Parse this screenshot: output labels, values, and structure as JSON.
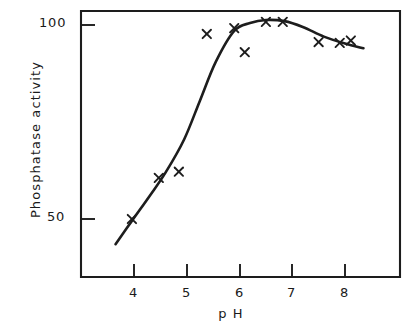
{
  "figure": {
    "background_color": "#ffffff",
    "ink_color": "#1d1d1d",
    "style": "hand-drawn scientific line plot, scanned journal figure"
  },
  "labels": {
    "ylabel": "Phosphatase activity",
    "xlabel": "p H"
  },
  "axes": {
    "y_ticks": [
      {
        "label": "100",
        "value": 100
      },
      {
        "label": "50",
        "value": 50
      }
    ],
    "x_ticks": [
      {
        "label": "4",
        "value": 4
      },
      {
        "label": "5",
        "value": 5
      },
      {
        "label": "6",
        "value": 6
      },
      {
        "label": "7",
        "value": 7
      },
      {
        "label": "8",
        "value": 8
      }
    ]
  },
  "chart_data": {
    "type": "scatter",
    "title": "",
    "xlabel": "p H",
    "ylabel": "Phosphatase activity",
    "xlim": [
      3.3,
      8.95
    ],
    "ylim": [
      31,
      106
    ],
    "grid": false,
    "legend": null,
    "marker": "x",
    "series": [
      {
        "name": "Phosphatase activity",
        "marker": "x",
        "points": [
          {
            "x": 3.96,
            "y": 50
          },
          {
            "x": 4.47,
            "y": 60.6
          },
          {
            "x": 4.85,
            "y": 62.2
          },
          {
            "x": 5.38,
            "y": 97.7
          },
          {
            "x": 5.9,
            "y": 99.2
          },
          {
            "x": 6.1,
            "y": 93.0
          },
          {
            "x": 6.5,
            "y": 100.8
          },
          {
            "x": 6.82,
            "y": 100.8
          },
          {
            "x": 7.5,
            "y": 95.6
          },
          {
            "x": 7.9,
            "y": 95.4
          },
          {
            "x": 8.11,
            "y": 96.0
          }
        ]
      }
    ],
    "fitted_curve": {
      "name": "hand-drawn sigmoid fit",
      "points": [
        {
          "x": 3.65,
          "y": 43.5
        },
        {
          "x": 3.96,
          "y": 49.5
        },
        {
          "x": 4.3,
          "y": 56.0
        },
        {
          "x": 4.6,
          "y": 62.0
        },
        {
          "x": 4.95,
          "y": 70.5
        },
        {
          "x": 5.25,
          "y": 80.5
        },
        {
          "x": 5.55,
          "y": 90.5
        },
        {
          "x": 5.9,
          "y": 98.5
        },
        {
          "x": 6.2,
          "y": 100.5
        },
        {
          "x": 6.5,
          "y": 101.3
        },
        {
          "x": 6.85,
          "y": 101.0
        },
        {
          "x": 7.2,
          "y": 99.5
        },
        {
          "x": 7.6,
          "y": 97.0
        },
        {
          "x": 8.0,
          "y": 95.2
        },
        {
          "x": 8.35,
          "y": 94.0
        }
      ]
    }
  }
}
